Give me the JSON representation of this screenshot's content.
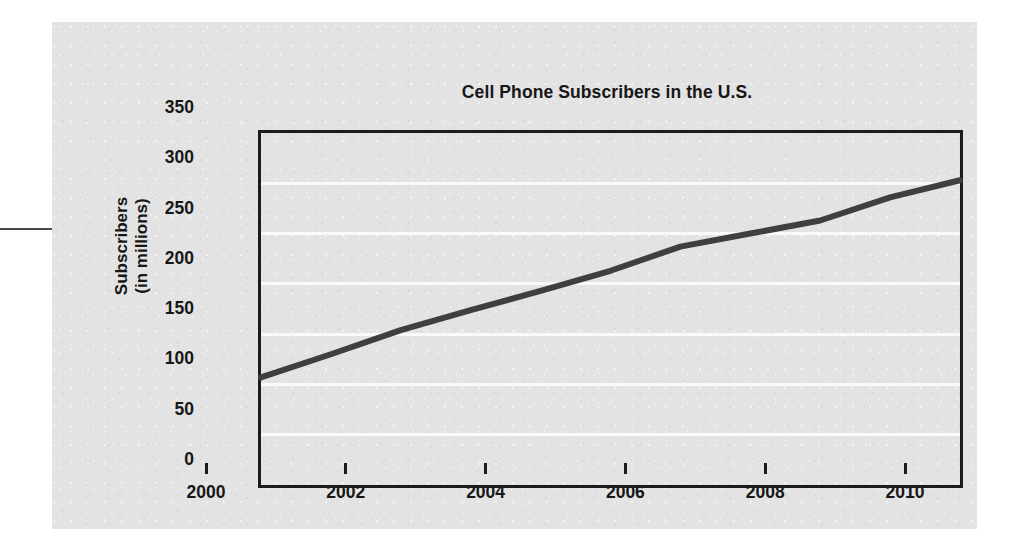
{
  "figure": {
    "title": "Cell Phone Subscribers in the U.S.",
    "yaxis_title_line1": "Subscribers",
    "yaxis_title_line2": "(in millions)"
  },
  "chart_data": {
    "type": "line",
    "title": "Cell Phone Subscribers in the U.S.",
    "xlabel": "",
    "ylabel": "Subscribers (in millions)",
    "xlim": [
      2000,
      2010
    ],
    "ylim": [
      0,
      350
    ],
    "grid": true,
    "legend": "none",
    "x_ticks": [
      "2000",
      "2002",
      "2004",
      "2006",
      "2008",
      "2010"
    ],
    "y_ticks": [
      "0",
      "50",
      "100",
      "150",
      "200",
      "250",
      "300",
      "350"
    ],
    "x": [
      2000,
      2001,
      2002,
      2003,
      2004,
      2005,
      2006,
      2007,
      2008,
      2009,
      2010
    ],
    "series": [
      {
        "name": "Cell phone subscribers",
        "values": [
          107,
          130,
          154,
          174,
          193,
          213,
          237,
          250,
          263,
          286,
          303
        ]
      }
    ]
  }
}
